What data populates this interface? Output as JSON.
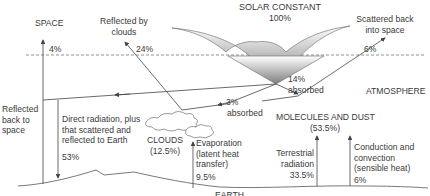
{
  "diagram": {
    "title": "SOLAR CONSTANT",
    "title_value": "100%",
    "regions": {
      "space": "SPACE",
      "atmosphere": "ATMOSPHERE",
      "earth": "EARTH"
    },
    "flows": {
      "space_pct": "4%",
      "reflected_clouds_label": "Reflected by\nclouds",
      "reflected_clouds_pct": "24%",
      "scattered_label": "Scattered back\ninto space",
      "scattered_pct": "6%",
      "absorbed14_pct": "14%",
      "absorbed14_label": "absorbed",
      "absorbed3_pct": "3%",
      "absorbed3_label": "absorbed",
      "reflected_back_label": "Reflected\nback to\nspace",
      "direct_label": "Direct radiation, plus\nthat scattered and\nreflected to Earth",
      "direct_pct": "53%",
      "clouds_label": "CLOUDS",
      "clouds_pct": "(12.5%)",
      "evaporation_label": "Evaporation\n(latent heat\ntransfer)",
      "evaporation_pct": "9.5%",
      "molecules_label": "MOLECULES AND DUST",
      "molecules_pct": "(53.5%)",
      "terrestrial_label": "Terrestrial\nradiation",
      "terrestrial_pct": "33.5%",
      "conduction_label": "Conduction and\nconvection\n(sensible heat)",
      "conduction_pct": "6%"
    },
    "colors": {
      "line": "#555555",
      "arrow_dark": "#8a8a8a",
      "arrow_light": "#f4f4f4",
      "text": "#3a3a3a"
    }
  }
}
